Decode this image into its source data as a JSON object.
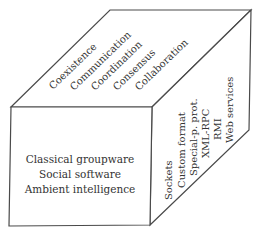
{
  "diagram": {
    "type": "3d-cube-taxonomy",
    "top_face": {
      "labels": [
        "Coexistence",
        "Communication",
        "Coordination",
        "Consensus",
        "Collaboration"
      ]
    },
    "front_face": {
      "labels": [
        "Classical groupware",
        "Social software",
        "Ambient intelligence"
      ]
    },
    "right_face": {
      "labels": [
        "Sockets",
        "Custom format",
        "Special-p. prot.",
        "XML-RPC",
        "RMI",
        "Web services"
      ]
    },
    "colors": {
      "edge": "#4a4a4a",
      "text": "#333333",
      "background": "#ffffff"
    }
  }
}
